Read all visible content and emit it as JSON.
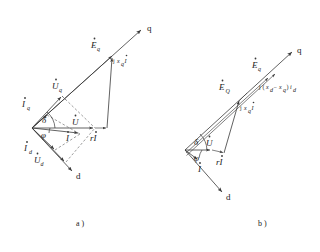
{
  "figure": {
    "title": "",
    "background": "#ffffff",
    "ink": "#3a3a3a",
    "captions": [
      {
        "id": "caption-a",
        "text": "a )"
      },
      {
        "id": "caption-b",
        "text": "b )"
      }
    ]
  },
  "diagram_a": {
    "name": "salient-pole-phasor-diagram-a",
    "axes": [
      {
        "id": "q-axis",
        "label": "q"
      },
      {
        "id": "d-axis",
        "label": "d"
      }
    ],
    "angles": [
      {
        "id": "delta-angle",
        "symbol": "δ"
      },
      {
        "id": "phi-angle",
        "symbol": "φ"
      }
    ],
    "phasors": [
      {
        "id": "E-q",
        "base": "E",
        "sub": "q",
        "dot": true,
        "label": "Ėq"
      },
      {
        "id": "U-q",
        "base": "U",
        "sub": "q",
        "dot": true,
        "label": "U̇q"
      },
      {
        "id": "U-d",
        "base": "U",
        "sub": "d",
        "dot": true,
        "label": "U̇d"
      },
      {
        "id": "U",
        "base": "U",
        "sub": "",
        "dot": true,
        "label": "U̇"
      },
      {
        "id": "I-q",
        "base": "I",
        "sub": "q",
        "dot": true,
        "label": "İq"
      },
      {
        "id": "I-d",
        "base": "I",
        "sub": "d",
        "dot": true,
        "label": "İd"
      },
      {
        "id": "I",
        "base": "I",
        "sub": "",
        "dot": true,
        "label": "İ"
      },
      {
        "id": "rI",
        "base": "rI",
        "sub": "",
        "dot": true,
        "label": "rİ"
      },
      {
        "id": "jxqI",
        "base": "jxqI",
        "sub": "q",
        "dot": true,
        "label": "jxqİ",
        "parts": {
          "j": "j",
          "x": "x",
          "xsub": "q",
          "I": "I"
        }
      }
    ]
  },
  "diagram_b": {
    "name": "salient-pole-phasor-diagram-b",
    "axes": [
      {
        "id": "q-axis",
        "label": "q"
      },
      {
        "id": "d-axis",
        "label": "d"
      }
    ],
    "angles": [
      {
        "id": "delta-angle",
        "symbol": "δ"
      },
      {
        "id": "phi-angle",
        "symbol": "φ"
      }
    ],
    "phasors": [
      {
        "id": "E-q",
        "base": "E",
        "sub": "q",
        "dot": true,
        "label": "Ėq"
      },
      {
        "id": "E-Q",
        "base": "E",
        "sub": "Q",
        "dot": true,
        "label": "ĖQ"
      },
      {
        "id": "U",
        "base": "U",
        "sub": "",
        "dot": true,
        "label": "U̇"
      },
      {
        "id": "I",
        "base": "I",
        "sub": "",
        "dot": true,
        "label": "İ"
      },
      {
        "id": "rI",
        "base": "rI",
        "sub": "",
        "dot": true,
        "label": "rİ"
      },
      {
        "id": "jxqI",
        "base": "jxqI",
        "sub": "q",
        "dot": true,
        "label": "jxqİ",
        "parts": {
          "j": "j",
          "x": "x",
          "xsub": "q",
          "I": "I"
        }
      }
    ],
    "expression": {
      "id": "reactance-difference-term",
      "parts": {
        "j": "j",
        "open": "(",
        "x1": "x",
        "x1sub": "d",
        "minus": "−",
        "x2": "x",
        "x2sub": "q",
        "close": ")",
        "i": "i",
        "isub": "d"
      },
      "text": "j( xd − xq )id"
    }
  }
}
